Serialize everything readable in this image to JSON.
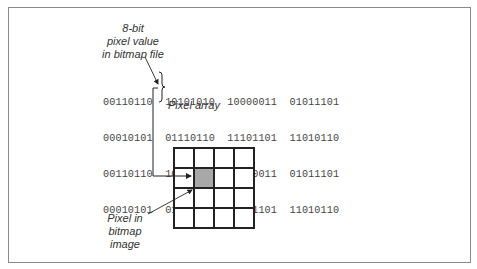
{
  "diagram": {
    "labels": {
      "pixel_value": [
        "8-bit",
        "pixel value",
        "in bitmap file"
      ],
      "pixel_array": "Pixel array",
      "pixel_image": [
        "Pixel in",
        "bitmap",
        "image"
      ]
    },
    "pixel_array_rows": [
      [
        "00110110",
        "10101010",
        "10000011",
        "01011101"
      ],
      [
        "00010101",
        "01110110",
        "11101101",
        "11010110"
      ],
      [
        "00110110",
        "10101010",
        "10000011",
        "01011101"
      ],
      [
        "00010101",
        "01110110",
        "11101101",
        "11010110"
      ]
    ],
    "highlighted_value": {
      "row": 1,
      "col": 1,
      "value": "01110110"
    },
    "bitmap_grid": {
      "rows": 4,
      "cols": 4,
      "highlighted_cell": {
        "row": 1,
        "col": 1
      }
    },
    "colors": {
      "highlight": "#a8a8a8",
      "line": "#222222",
      "frame": "#8a8a8a"
    }
  }
}
